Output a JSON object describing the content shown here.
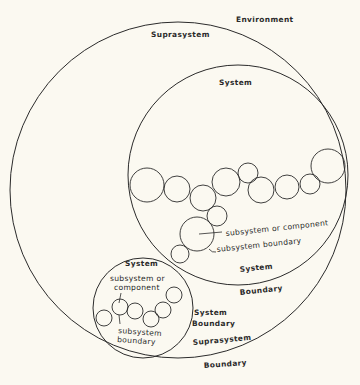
{
  "diagram": {
    "background": "#fbf9f1",
    "stroke_color": "#2b2b2b",
    "labels": {
      "environment": "Environment",
      "suprasystem": "Suprasystem",
      "system_large": "System",
      "subsystem_or_component_large": "subsystem or component",
      "subsystem_boundary_large": "subsystem boundary",
      "system_boundary_large_1": "System",
      "system_boundary_large_2": "Boundary",
      "system_small": "System",
      "subsystem_or_component_small_1": "subsystem or",
      "subsystem_or_component_small_2": "component",
      "subsystem_boundary_small_1": "subsystem",
      "subsystem_boundary_small_2": "boundary",
      "system_boundary_small_1": "System",
      "system_boundary_small_2": "Boundary",
      "suprasystem_boundary_1": "Suprasystem",
      "suprasystem_boundary_2": "Boundary"
    },
    "circles": {
      "suprasystem": {
        "cx": 178,
        "cy": 190,
        "r": 168
      },
      "system_large": {
        "cx": 238,
        "cy": 175,
        "r": 110
      },
      "system_small": {
        "cx": 143,
        "cy": 308,
        "r": 50
      }
    },
    "subsystems_large": [
      {
        "cx": 147,
        "cy": 185,
        "r": 17
      },
      {
        "cx": 177,
        "cy": 189,
        "r": 13
      },
      {
        "cx": 203,
        "cy": 198,
        "r": 13
      },
      {
        "cx": 226,
        "cy": 182,
        "r": 14
      },
      {
        "cx": 248,
        "cy": 173,
        "r": 10
      },
      {
        "cx": 261,
        "cy": 190,
        "r": 13
      },
      {
        "cx": 287,
        "cy": 187,
        "r": 12
      },
      {
        "cx": 310,
        "cy": 184,
        "r": 10
      },
      {
        "cx": 328,
        "cy": 166,
        "r": 17
      },
      {
        "cx": 217,
        "cy": 216,
        "r": 10
      },
      {
        "cx": 197,
        "cy": 234,
        "r": 17
      },
      {
        "cx": 180,
        "cy": 254,
        "r": 9
      }
    ],
    "subsystems_small": [
      {
        "cx": 104,
        "cy": 318,
        "r": 8
      },
      {
        "cx": 120,
        "cy": 307,
        "r": 8
      },
      {
        "cx": 135,
        "cy": 311,
        "r": 8
      },
      {
        "cx": 151,
        "cy": 319,
        "r": 8
      },
      {
        "cx": 163,
        "cy": 310,
        "r": 8
      },
      {
        "cx": 174,
        "cy": 295,
        "r": 8
      }
    ]
  }
}
